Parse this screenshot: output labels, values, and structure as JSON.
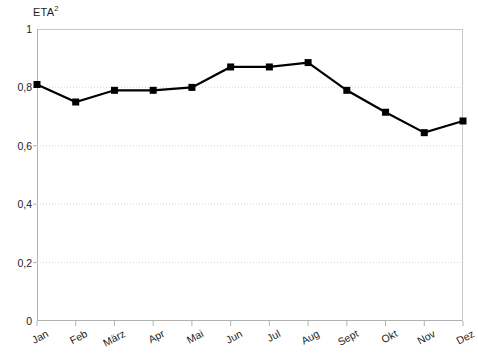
{
  "chart_data": {
    "type": "line",
    "title_base": "ETA",
    "title_sup": "2",
    "xlabel": "",
    "ylabel": "",
    "categories": [
      "Jan",
      "Feb",
      "März",
      "Apr",
      "Mai",
      "Jun",
      "Jul",
      "Aug",
      "Sept",
      "Okt",
      "Nov",
      "Dez"
    ],
    "values": [
      0.81,
      0.75,
      0.79,
      0.79,
      0.8,
      0.87,
      0.87,
      0.885,
      0.79,
      0.715,
      0.645,
      0.685
    ],
    "ylim": [
      0,
      1
    ],
    "yticks": [
      0,
      0.2,
      0.4,
      0.6,
      0.8,
      1
    ],
    "ytick_labels": [
      "0",
      "0,2",
      "0,4",
      "0,6",
      "0,8",
      "1"
    ],
    "grid": true,
    "grid_axis": "y",
    "legend": "none",
    "series_name": "ETA²",
    "marker": "square",
    "line_color": "#000000",
    "marker_color": "#000000",
    "grid_color": "#d9d9d9",
    "axis_color": "#b2b2b2",
    "background": "#ffffff"
  },
  "axes": {
    "y_label_rotation": 0,
    "x_label_rotation": -28
  }
}
